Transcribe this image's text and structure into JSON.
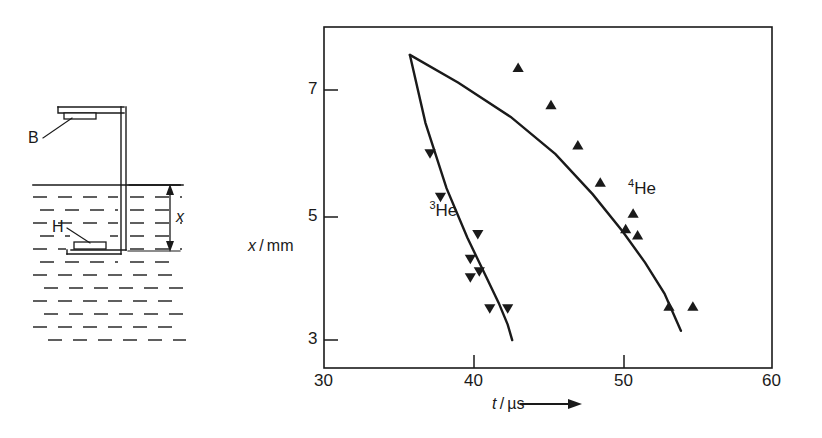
{
  "figure": {
    "panels": [
      "apparatus-diagram",
      "xy-plot"
    ]
  },
  "diagram": {
    "name": "apparatus-cross-section",
    "labels": [
      {
        "id": "B",
        "text": "B",
        "meaning": "upper-plate-label"
      },
      {
        "id": "H",
        "text": "H",
        "meaning": "lower-heater-label"
      },
      {
        "id": "x",
        "text": "x",
        "meaning": "gap-distance-dimension"
      }
    ],
    "liquid_fill": "dashed-hatch",
    "line_color": "#1a1a1a"
  },
  "chart_data": {
    "type": "scatter",
    "title": "",
    "xlabel": "t / µs",
    "ylabel": "x / mm",
    "xlim": [
      30,
      60
    ],
    "ylim": [
      2.4,
      7.9
    ],
    "xticks": [
      30,
      40,
      50,
      60
    ],
    "xticklabels": [
      "30",
      "40",
      "50",
      "60"
    ],
    "yticks": [
      3,
      5,
      7
    ],
    "yticklabels": [
      "3",
      "5",
      "7"
    ],
    "grid": false,
    "legend": "inline-annotation",
    "series": [
      {
        "name": "3He",
        "label_html": "³He",
        "superscript": "3",
        "base": "He",
        "marker": "triangle-down",
        "color": "#1a1a1a",
        "x": [
          37.1,
          37.8,
          40.3,
          39.8,
          40.4,
          39.8,
          41.1,
          42.3
        ],
        "y": [
          5.85,
          5.15,
          4.55,
          4.15,
          3.95,
          3.85,
          3.35,
          3.35
        ],
        "fit_curve": {
          "x": [
            35.75,
            36.8,
            38.2,
            39.6,
            40.8,
            41.7,
            42.3,
            42.6
          ],
          "y": [
            7.45,
            6.35,
            5.3,
            4.5,
            3.9,
            3.45,
            3.1,
            2.85
          ]
        },
        "label_pos": {
          "x": 38.0,
          "y": 4.95
        }
      },
      {
        "name": "4He",
        "label_html": "⁴He",
        "superscript": "4",
        "base": "He",
        "marker": "triangle-up",
        "color": "#1a1a1a",
        "x": [
          43.0,
          45.2,
          47.0,
          48.5,
          50.2,
          50.7,
          51.0,
          53.1,
          54.7
        ],
        "y": [
          7.25,
          6.65,
          6.0,
          5.4,
          4.65,
          4.9,
          4.55,
          3.4,
          3.4
        ],
        "fit_curve": {
          "x": [
            35.75,
            39.0,
            42.5,
            45.5,
            48.0,
            50.0,
            51.5,
            52.8,
            53.9
          ],
          "y": [
            7.45,
            7.0,
            6.45,
            5.85,
            5.2,
            4.6,
            4.1,
            3.6,
            3.0
          ]
        },
        "label_pos": {
          "x": 51.3,
          "y": 5.3
        }
      }
    ]
  },
  "axis_arrows": {
    "x_arrow": "right-arrow-after-xlabel",
    "y_arrow": "up-arrow-above-ylabel"
  }
}
